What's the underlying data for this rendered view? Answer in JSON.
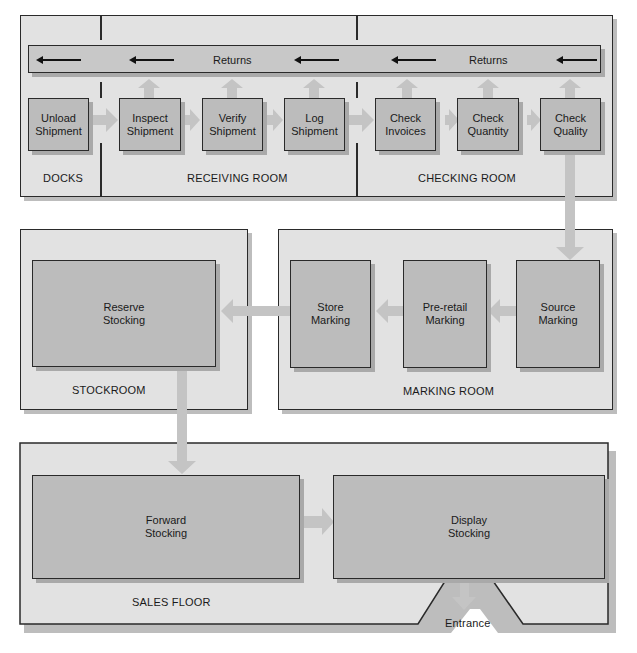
{
  "diagram": {
    "returns_label": "Returns",
    "rooms": {
      "docks": "DOCKS",
      "receiving": "RECEIVING ROOM",
      "checking": "CHECKING ROOM",
      "stockroom": "STOCKROOM",
      "marking": "MARKING ROOM",
      "sales": "SALES FLOOR"
    },
    "steps": {
      "unload": "Unload\nShipment",
      "inspect": "Inspect\nShipment",
      "verify": "Verify\nShipment",
      "log": "Log\nShipment",
      "invoices": "Check\nInvoices",
      "quantity": "Check\nQuantity",
      "quality": "Check\nQuality",
      "source": "Source\nMarking",
      "preretail": "Pre-retail\nMarking",
      "store": "Store\nMarking",
      "reserve": "Reserve\nStocking",
      "forward": "Forward\nStocking",
      "display": "Display\nStocking"
    },
    "entrance": "Entrance",
    "colors": {
      "room_fill": "#e2e2e2",
      "box_fill": "#bcbcbc",
      "arrow_fill": "#c4c4c4",
      "outline": "#2a2a2a"
    }
  }
}
